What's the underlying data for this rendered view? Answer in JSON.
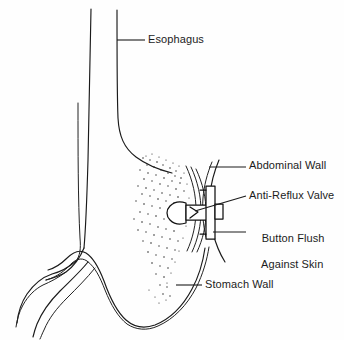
{
  "figure": {
    "type": "medical-line-illustration",
    "background_color": "#fefefe",
    "line_color": "#1a1a1a",
    "text_color": "#1c1c1c"
  },
  "labels": {
    "esophagus": "Esophagus",
    "abdominal_wall": "Abdominal Wall",
    "anti_reflux_valve": "Anti-Reflux Valve",
    "button_flush_line1": "Button Flush",
    "button_flush_line2": "Against Skin",
    "stomach_wall": "Stomach Wall"
  },
  "anatomy_parts": [
    "esophagus",
    "stomach-fundus",
    "stomach-body",
    "stomach-greater-curvature",
    "duodenum",
    "abdominal-wall",
    "gastric-contents-stippling"
  ],
  "device_parts": [
    "internal-mushroom-bolster",
    "anti-reflux-valve",
    "button-shaft",
    "external-button-flange",
    "button-cap"
  ]
}
